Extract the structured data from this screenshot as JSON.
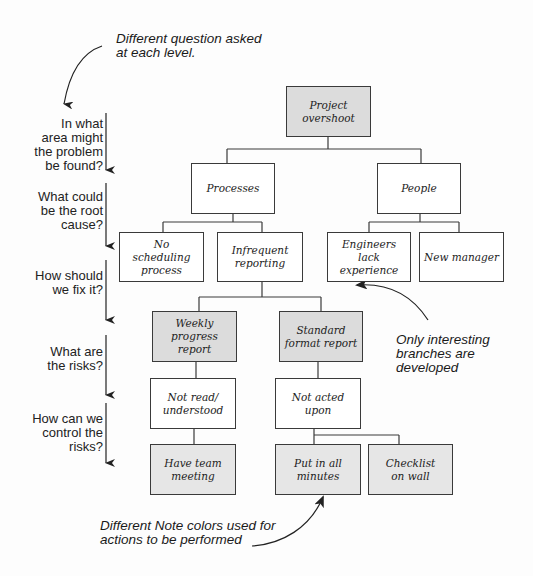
{
  "diagram": {
    "type": "issue-tree",
    "colors": {
      "line": "#3a3a3a",
      "shaded_node": "#dcdcdc",
      "plain_node": "#ffffff",
      "text": "#1c1c1c"
    },
    "annotations": {
      "top": "Different question asked\nat each level.",
      "right": "Only interesting\nbranches are\ndeveloped",
      "bottom": "Different Note colors used for\nactions to be performed"
    },
    "level_questions": [
      "In what\narea might\nthe problem\nbe found?",
      "What could\nbe the root\ncause?",
      "How should\nwe fix it?",
      "What are\nthe risks?",
      "How can we\ncontrol the\nrisks?"
    ],
    "nodes": {
      "root": "Project\novershoot",
      "processes": "Processes",
      "people": "People",
      "no_scheduling": "No scheduling\nprocess",
      "infrequent_reporting": "Infrequent\nreporting",
      "engineers_lack": "Engineers lack\nexperience",
      "new_manager": "New manager",
      "weekly_report": "Weekly\nprogress report",
      "standard_report": "Standard\nformat report",
      "not_read": "Not read/\nunderstood",
      "not_acted": "Not acted upon",
      "team_meeting": "Have team\nmeeting",
      "put_in_minutes": "Put in all\nminutes",
      "checklist": "Checklist\non wall"
    }
  }
}
